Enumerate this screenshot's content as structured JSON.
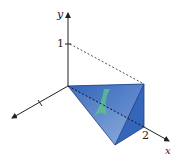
{
  "figure": {
    "axes": {
      "y_label": "y",
      "x_label": "x",
      "y_tick_label": "1",
      "x_tick_label": "2"
    },
    "solid": {
      "type": "tetrahedron",
      "fill_color": "#3f73c4",
      "slice_color": "#5cc28a"
    }
  }
}
